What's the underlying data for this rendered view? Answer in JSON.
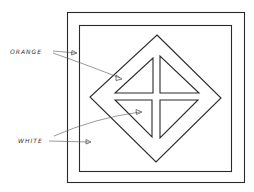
{
  "diagram": {
    "type": "pattern-sketch",
    "labels": [
      {
        "id": "orange",
        "text": "ORANGE",
        "x": 10,
        "y": 54
      },
      {
        "id": "white",
        "text": "WHITE",
        "x": 18,
        "y": 143
      }
    ],
    "colors": {
      "stroke": "#2a2a2a",
      "background": "#ffffff"
    },
    "shapes": {
      "outer_square": {
        "x": 67,
        "y": 12,
        "w": 178,
        "h": 171
      },
      "inner_square": {
        "x": 79,
        "y": 25,
        "w": 153,
        "h": 147
      },
      "diamond": {
        "top": [
          157,
          35
        ],
        "right": [
          221,
          98
        ],
        "bottom": [
          156,
          162
        ],
        "left": [
          90,
          97
        ]
      },
      "triangles": [
        {
          "id": "top-left",
          "points": [
            [
              153,
              58
            ],
            [
              153,
              93
            ],
            [
              115,
              93
            ]
          ]
        },
        {
          "id": "top-right",
          "points": [
            [
              160,
              56
            ],
            [
              160,
              93
            ],
            [
              199,
              93
            ]
          ]
        },
        {
          "id": "bottom-left",
          "points": [
            [
              115,
              100
            ],
            [
              152,
              100
            ],
            [
              152,
              137
            ]
          ]
        },
        {
          "id": "bottom-right",
          "points": [
            [
              160,
              100
            ],
            [
              198,
              100
            ],
            [
              160,
              138
            ]
          ]
        }
      ]
    },
    "arrows": [
      {
        "from_label": "orange",
        "target": "outer-border",
        "from": [
          53,
          51
        ],
        "to": [
          77,
          53
        ]
      },
      {
        "from_label": "orange",
        "target": "diamond-frame",
        "from": [
          53,
          53
        ],
        "to": [
          121,
          79
        ]
      },
      {
        "from_label": "white",
        "target": "inner-background",
        "from": [
          49,
          141
        ],
        "to": [
          90,
          142
        ]
      },
      {
        "from_label": "white",
        "target": "triangle",
        "from": [
          54,
          136
        ],
        "to": [
          141,
          112
        ]
      }
    ]
  }
}
